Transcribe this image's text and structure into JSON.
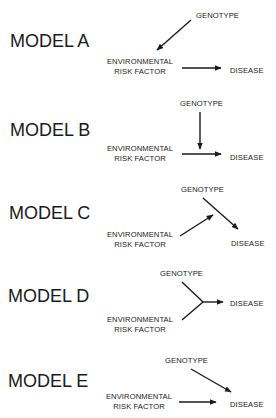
{
  "diagram": {
    "type": "causal-models",
    "models": [
      {
        "label": "MODEL A",
        "nodes": {
          "genotype": "GENOTYPE",
          "environment_line1": "ENVIRONMENTAL",
          "environment_line2": "RISK FACTOR",
          "disease": "DISEASE"
        },
        "edges": [
          {
            "from": "GENOTYPE",
            "to": "ENVIRONMENTAL RISK FACTOR"
          },
          {
            "from": "ENVIRONMENTAL RISK FACTOR",
            "to": "DISEASE"
          }
        ]
      },
      {
        "label": "MODEL B",
        "nodes": {
          "genotype": "GENOTYPE",
          "environment_line1": "ENVIRONMENTAL",
          "environment_line2": "RISK FACTOR",
          "disease": "DISEASE"
        },
        "edges": [
          {
            "from": "ENVIRONMENTAL RISK FACTOR",
            "to": "DISEASE"
          },
          {
            "from": "GENOTYPE",
            "to": "ENVIRONMENTAL RISK FACTOR → DISEASE edge"
          }
        ]
      },
      {
        "label": "MODEL C",
        "nodes": {
          "genotype": "GENOTYPE",
          "environment_line1": "ENVIRONMENTAL",
          "environment_line2": "RISK FACTOR",
          "disease": "DISEASE"
        },
        "edges": [
          {
            "from": "ENVIRONMENTAL RISK FACTOR",
            "to": "GENOTYPE → DISEASE edge"
          },
          {
            "from": "GENOTYPE",
            "to": "DISEASE"
          }
        ]
      },
      {
        "label": "MODEL D",
        "nodes": {
          "genotype": "GENOTYPE",
          "environment_line1": "ENVIRONMENTAL",
          "environment_line2": "RISK FACTOR",
          "disease": "DISEASE"
        },
        "edges": [
          {
            "from": "GENOTYPE + ENVIRONMENTAL RISK FACTOR (joint)",
            "to": "DISEASE"
          }
        ]
      },
      {
        "label": "MODEL E",
        "nodes": {
          "genotype": "GENOTYPE",
          "environment_line1": "ENVIRONMENTAL",
          "environment_line2": "RISK FACTOR",
          "disease": "DISEASE"
        },
        "edges": [
          {
            "from": "GENOTYPE",
            "to": "DISEASE"
          },
          {
            "from": "ENVIRONMENTAL RISK FACTOR",
            "to": "DISEASE"
          }
        ]
      }
    ],
    "colors": {
      "ink": "#1a1a1a",
      "background": "#ffffff"
    }
  }
}
